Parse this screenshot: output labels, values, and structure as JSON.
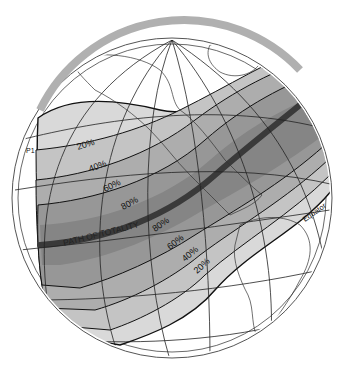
{
  "map": {
    "type": "orthographic-globe",
    "subject": "partial solar eclipse obscuration map",
    "colors": {
      "background": "#ffffff",
      "globe_rim": "#b8b8b8",
      "ocean": "#ffffff",
      "band_20": "#d9d9d9",
      "band_40": "#c4c4c4",
      "band_60": "#adadad",
      "band_80": "#979797",
      "band_core": "#858585",
      "totality_path": "#3a3a3a",
      "grid_line": "#222222",
      "coast_line": "#333333"
    },
    "labels": {
      "path": "PATH OF TOTALITY",
      "equator": "Equator",
      "p1": "P1",
      "north_20": "20%",
      "north_40": "40%",
      "north_60": "60%",
      "north_80": "80%",
      "south_80": "80%",
      "south_60": "60%",
      "south_40": "40%",
      "south_20": "20%"
    }
  }
}
